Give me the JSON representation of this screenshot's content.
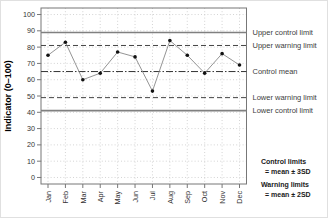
{
  "chart_data": {
    "type": "line",
    "title": "",
    "categories": [
      "Jan",
      "Feb",
      "Mar",
      "Apr",
      "May",
      "Jun",
      "Jul",
      "Aug",
      "Sep",
      "Oct",
      "Nov",
      "Dec"
    ],
    "values": [
      75,
      83,
      60,
      64,
      77,
      74,
      53,
      84,
      75,
      64,
      76,
      69
    ],
    "xlabel": "",
    "ylabel": "Indicator (0–100)",
    "ylim": [
      0,
      100
    ],
    "ytick_interval": 10,
    "grid": true,
    "legend_position": "none",
    "marker": "filled-circle",
    "reference_lines": [
      {
        "id": "upper-control",
        "value": 89,
        "label": "Upper control limit",
        "style": "solid"
      },
      {
        "id": "upper-warning",
        "value": 81,
        "label": "Upper warning limit",
        "style": "dashed"
      },
      {
        "id": "control-mean",
        "value": 65,
        "label": "Control mean",
        "style": "dashdot"
      },
      {
        "id": "lower-warning",
        "value": 49,
        "label": "Lower warning limit",
        "style": "dashed"
      },
      {
        "id": "lower-control",
        "value": 41,
        "label": "Lower control limit",
        "style": "solid"
      }
    ],
    "annotations": [
      {
        "id": "control-limits-note",
        "lines": [
          "Control limits",
          "=  mean ± 3SD"
        ]
      },
      {
        "id": "warning-limits-note",
        "lines": [
          "Warning limits",
          "=  mean ± 2SD"
        ]
      }
    ],
    "colors": {
      "point": "#111111",
      "series_line": "#888888",
      "control_line": "#808080",
      "warning_line": "#444444",
      "mean_line": "#333333",
      "grid": "#c9c9c9",
      "box": "#777777",
      "tick_text": "#333333",
      "ref_label_text": "#3d3d3d",
      "annotation_text": "#1a1a1a"
    }
  }
}
